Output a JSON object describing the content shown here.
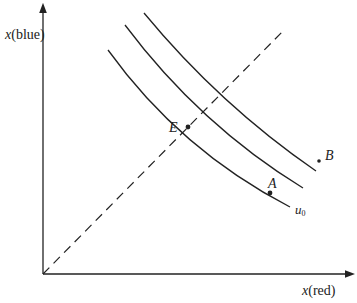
{
  "diagram": {
    "type": "indifference-curve-diagram",
    "colors": {
      "ink": "#222222",
      "background": "#ffffff"
    },
    "axes": {
      "y_label_var": "x",
      "y_label_paren": "(blue)",
      "x_label_var": "x",
      "x_label_paren": "(red)"
    },
    "curves": [
      {
        "id": "u0",
        "label": "u",
        "label_sub": "0"
      },
      {
        "id": "middle",
        "label": ""
      },
      {
        "id": "outer",
        "label": ""
      }
    ],
    "points": [
      {
        "id": "E",
        "label": "E"
      },
      {
        "id": "A",
        "label": "A"
      },
      {
        "id": "B",
        "label": "B"
      }
    ],
    "reference_line": {
      "style": "dashed",
      "description": "45-degree line from origin"
    }
  }
}
